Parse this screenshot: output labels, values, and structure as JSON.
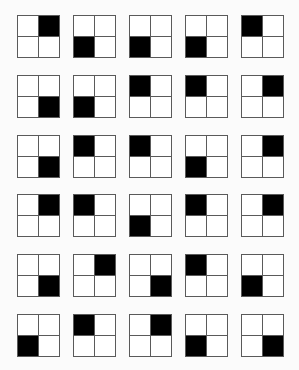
{
  "puzzle": {
    "description": "Grid of 2x2 boxes, each with one black-filled quadrant",
    "fill_color": "#000000",
    "border_color": "#5a5a5a",
    "layout": {
      "rows": 6,
      "cols": 5,
      "col_lefts": [
        17,
        73,
        129,
        185,
        241
      ],
      "row_tops": [
        15,
        75,
        135,
        194,
        254,
        314
      ],
      "box_size": 43
    },
    "rows": [
      [
        "TR",
        "BL",
        "BL",
        "BL",
        "TL"
      ],
      [
        "BR",
        "BL",
        "TL",
        "TL",
        "TR"
      ],
      [
        "BR",
        "TL",
        "TL",
        "BL",
        "TR"
      ],
      [
        "TR",
        "TL",
        "BL",
        "TL",
        "TR"
      ],
      [
        "BR",
        "TR",
        "BR",
        "TL",
        "BL"
      ],
      [
        "BL",
        "TL",
        "TR",
        "BL",
        "BR"
      ]
    ]
  }
}
